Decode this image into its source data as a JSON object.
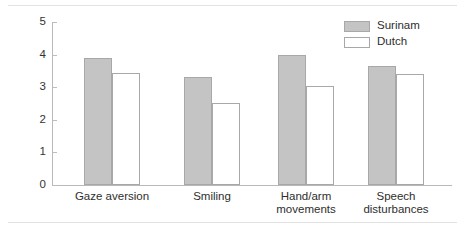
{
  "chart_data": {
    "type": "bar",
    "title": "",
    "xlabel": "",
    "ylabel": "",
    "ylim": [
      0,
      5
    ],
    "yticks": [
      "0",
      "1",
      "2",
      "3",
      "4",
      "5"
    ],
    "grid": false,
    "legend_position": "top-right",
    "categories": [
      "Gaze aversion",
      "Smiling",
      "Hand/arm\nmovements",
      "Speech\ndisturbances"
    ],
    "series": [
      {
        "name": "Surinam",
        "color": "#c4c4c4",
        "values": [
          3.9,
          3.3,
          4.0,
          3.65
        ]
      },
      {
        "name": "Dutch",
        "color": "#ffffff",
        "values": [
          3.45,
          2.5,
          3.05,
          3.4
        ]
      }
    ]
  }
}
